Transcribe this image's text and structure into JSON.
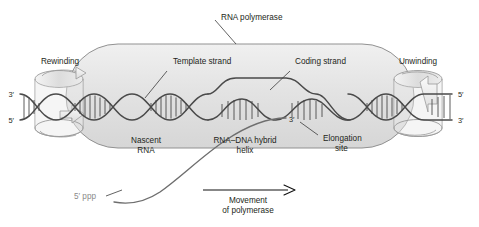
{
  "figure": {
    "background_color": "#ffffff",
    "enzyme_fill": "#e4e4e4",
    "enzyme_stroke": "#8f8f8f",
    "dna_stroke": "#4a4a4a",
    "rna_stroke": "#6e6e6e",
    "label_color": "#231f20",
    "gray_label_color": "#8a8a8a"
  },
  "labels": {
    "rna_polymerase": "RNA polymerase",
    "template_strand": "Template strand",
    "coding_strand": "Coding strand",
    "rewinding": "Rewinding",
    "unwinding": "Unwinding",
    "nascent_rna_line1": "Nascent",
    "nascent_rna_line2": "RNA",
    "hybrid_line1": "RNA–DNA hybrid",
    "hybrid_line2": "helix",
    "elongation_line1": "Elongation",
    "elongation_line2": "site",
    "five_prime_ppp": "5′ ppp",
    "movement_line1": "Movement",
    "movement_line2": "of polymerase"
  },
  "end_labels": {
    "left_top": "3′",
    "left_bottom": "5′",
    "right_top": "5′",
    "right_bottom": "3′",
    "rna_three_prime": "3′"
  },
  "diagram_data": {
    "type": "biological-schematic",
    "components": [
      {
        "name": "rna-polymerase-body",
        "shape": "rounded-capsule",
        "description": "Large gray rounded enclosure spanning the centre of the figure"
      },
      {
        "name": "dna-double-helix",
        "description": "Two sinusoidal strands with ladder rungs running horizontally across the figure"
      },
      {
        "name": "transcription-bubble",
        "description": "Region where coding strand arcs upward away from the template strand"
      },
      {
        "name": "nascent-rna-strand",
        "description": "Curved gray strand emerging from the elongation site down to the lower left, ending at 5' ppp"
      },
      {
        "name": "rewinding-coil",
        "description": "Helical coil with curved arrow on the left end of the DNA"
      },
      {
        "name": "unwinding-coil",
        "description": "Helical coil with curved arrow on the right end of the DNA"
      },
      {
        "name": "movement-arrow",
        "direction": "left-to-right",
        "description": "Horizontal arrow beneath the polymerase indicating direction of travel"
      }
    ]
  }
}
